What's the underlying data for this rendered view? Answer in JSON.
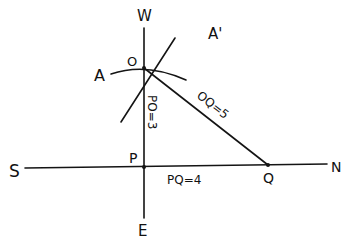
{
  "diagram": {
    "type": "geometry-construction",
    "compass": {
      "north": "N",
      "south": "S",
      "east": "E",
      "west": "W"
    },
    "points": {
      "O": "O",
      "P": "P",
      "Q": "Q",
      "A": "A",
      "A_prime": "A'"
    },
    "measurements": {
      "PO": "PO=3",
      "PQ": "PQ=4",
      "OQ": "OQ=5"
    },
    "colors": {
      "ink": "#141414",
      "background": "#ffffff"
    }
  }
}
